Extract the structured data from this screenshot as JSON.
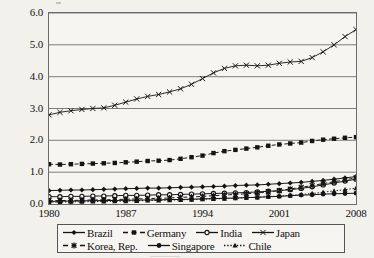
{
  "chart_data": {
    "type": "line",
    "title": "",
    "xlabel": "",
    "ylabel": "",
    "xlim": [
      1980,
      2008
    ],
    "ylim": [
      0.0,
      6.0
    ],
    "grid": "horizontal",
    "legend_position": "bottom",
    "x": [
      1980,
      1981,
      1982,
      1983,
      1984,
      1985,
      1986,
      1987,
      1988,
      1989,
      1990,
      1991,
      1992,
      1993,
      1994,
      1995,
      1996,
      1997,
      1998,
      1999,
      2000,
      2001,
      2002,
      2003,
      2004,
      2005,
      2006,
      2007,
      2008
    ],
    "y_ticks": [
      "0.0",
      "1.0",
      "2.0",
      "3.0",
      "4.0",
      "5.0",
      "6.0"
    ],
    "y_tick_values": [
      0.0,
      1.0,
      2.0,
      3.0,
      4.0,
      5.0,
      6.0
    ],
    "x_ticks": [
      "1980",
      "1987",
      "1994",
      "2001",
      "2008"
    ],
    "x_tick_values": [
      1980,
      1987,
      1994,
      2001,
      2008
    ],
    "series": [
      {
        "name": "Brazil",
        "marker": "diamond",
        "line": "solid",
        "color": "#1a1a1a",
        "values": [
          0.42,
          0.43,
          0.44,
          0.44,
          0.45,
          0.46,
          0.47,
          0.48,
          0.49,
          0.5,
          0.5,
          0.51,
          0.52,
          0.53,
          0.54,
          0.55,
          0.56,
          0.58,
          0.59,
          0.6,
          0.62,
          0.64,
          0.66,
          0.68,
          0.71,
          0.74,
          0.78,
          0.82,
          0.86
        ]
      },
      {
        "name": "Germany",
        "marker": "square",
        "line": "dashed",
        "color": "#1a1a1a",
        "values": [
          1.25,
          1.24,
          1.25,
          1.26,
          1.27,
          1.28,
          1.29,
          1.31,
          1.33,
          1.35,
          1.36,
          1.38,
          1.42,
          1.47,
          1.52,
          1.6,
          1.66,
          1.7,
          1.74,
          1.78,
          1.83,
          1.87,
          1.9,
          1.93,
          1.98,
          2.02,
          2.05,
          2.08,
          2.1
        ]
      },
      {
        "name": "India",
        "marker": "circle-open",
        "line": "solid",
        "color": "#1a1a1a",
        "values": [
          0.23,
          0.23,
          0.24,
          0.24,
          0.25,
          0.25,
          0.26,
          0.27,
          0.27,
          0.28,
          0.29,
          0.29,
          0.3,
          0.31,
          0.32,
          0.33,
          0.34,
          0.35,
          0.36,
          0.38,
          0.4,
          0.42,
          0.45,
          0.49,
          0.54,
          0.6,
          0.66,
          0.72,
          0.78
        ]
      },
      {
        "name": "Japan",
        "marker": "x",
        "line": "solid",
        "color": "#2b2b2b",
        "values": [
          2.8,
          2.88,
          2.93,
          2.97,
          3.0,
          3.02,
          3.1,
          3.2,
          3.3,
          3.38,
          3.44,
          3.52,
          3.62,
          3.76,
          3.94,
          4.12,
          4.26,
          4.34,
          4.36,
          4.34,
          4.36,
          4.42,
          4.46,
          4.48,
          4.6,
          4.78,
          5.0,
          5.26,
          5.48
        ]
      },
      {
        "name": "Korea, Rep.",
        "marker": "asterisk",
        "line": "dashed",
        "color": "#1a1a1a",
        "values": [
          0.1,
          0.11,
          0.11,
          0.12,
          0.13,
          0.13,
          0.14,
          0.15,
          0.16,
          0.17,
          0.18,
          0.19,
          0.21,
          0.22,
          0.24,
          0.26,
          0.28,
          0.3,
          0.32,
          0.35,
          0.38,
          0.42,
          0.47,
          0.52,
          0.58,
          0.64,
          0.7,
          0.76,
          0.82
        ]
      },
      {
        "name": "Singapore",
        "marker": "circle-filled",
        "line": "solid",
        "color": "#111111",
        "values": [
          0.08,
          0.09,
          0.09,
          0.1,
          0.1,
          0.11,
          0.11,
          0.12,
          0.12,
          0.13,
          0.13,
          0.14,
          0.14,
          0.15,
          0.16,
          0.17,
          0.18,
          0.19,
          0.2,
          0.21,
          0.23,
          0.24,
          0.26,
          0.28,
          0.29,
          0.31,
          0.32,
          0.33,
          0.34
        ]
      },
      {
        "name": "Chile",
        "marker": "triangle",
        "line": "dotted",
        "color": "#1a1a1a",
        "values": [
          0.06,
          0.06,
          0.07,
          0.07,
          0.08,
          0.08,
          0.09,
          0.09,
          0.1,
          0.11,
          0.11,
          0.12,
          0.13,
          0.14,
          0.15,
          0.16,
          0.17,
          0.18,
          0.2,
          0.21,
          0.23,
          0.25,
          0.27,
          0.3,
          0.33,
          0.37,
          0.41,
          0.45,
          0.5
        ]
      }
    ]
  },
  "legend": {
    "rows": [
      [
        {
          "label": "Brazil",
          "marker": "diamond",
          "line": "solid"
        },
        {
          "label": "Germany",
          "marker": "square",
          "line": "dashed"
        },
        {
          "label": "India",
          "marker": "circle-open",
          "line": "solid"
        },
        {
          "label": "Japan",
          "marker": "x",
          "line": "solid"
        }
      ],
      [
        {
          "label": "Korea, Rep.",
          "marker": "asterisk",
          "line": "dashed"
        },
        {
          "label": "Singapore",
          "marker": "circle-filled",
          "line": "solid"
        },
        {
          "label": "Chile",
          "marker": "triangle",
          "line": "dotted"
        }
      ]
    ]
  }
}
